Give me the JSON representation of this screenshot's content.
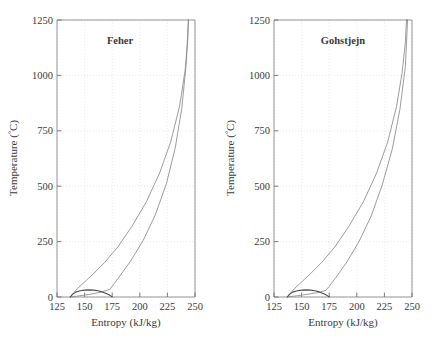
{
  "figure": {
    "panel_count": 2
  },
  "chart_data": [
    {
      "type": "line",
      "title": "Feher",
      "xlabel": "Entropy (kJ/kg)",
      "ylabel": "Temperature (°C)",
      "xlim": [
        125,
        250
      ],
      "ylim": [
        0,
        1250
      ],
      "xticks": [
        125,
        150,
        175,
        200,
        225,
        250
      ],
      "yticks": [
        0,
        250,
        500,
        750,
        1000,
        1250
      ],
      "xtick_labels": [
        "125",
        "150",
        "175",
        "200",
        "225",
        "250"
      ],
      "ytick_labels": [
        "0",
        "250",
        "500",
        "750",
        "1000",
        "1250"
      ],
      "grid": true,
      "legend": "none",
      "series": [
        {
          "name": "saturation-dome",
          "x": [
            137,
            139,
            142,
            146,
            150,
            154,
            158,
            162,
            166,
            169,
            172,
            174,
            175
          ],
          "y": [
            0,
            12,
            22,
            28,
            31,
            32,
            31,
            28,
            23,
            17,
            10,
            4,
            0
          ]
        },
        {
          "name": "cycle-upper-branch",
          "x": [
            137,
            140,
            144,
            150,
            158,
            168,
            180,
            193,
            206,
            218,
            228,
            236,
            241,
            243.5,
            244
          ],
          "y": [
            0,
            18,
            40,
            68,
            105,
            155,
            225,
            320,
            430,
            560,
            700,
            860,
            1020,
            1160,
            1250
          ]
        },
        {
          "name": "cycle-lower-branch",
          "x": [
            137,
            145,
            155,
            165,
            173,
            176,
            182,
            192,
            203,
            214,
            224,
            232,
            238,
            242,
            244
          ],
          "y": [
            0,
            5,
            12,
            22,
            35,
            55,
            95,
            165,
            255,
            370,
            510,
            670,
            850,
            1050,
            1250
          ]
        },
        {
          "name": "cycle-top-closure",
          "x": [
            244,
            244
          ],
          "y": [
            1250,
            1250
          ]
        }
      ]
    },
    {
      "type": "line",
      "title": "Gohstjejn",
      "xlabel": "Entropy (kJ/kg)",
      "ylabel": "Temperature (°C)",
      "xlim": [
        125,
        250
      ],
      "ylim": [
        0,
        1250
      ],
      "xticks": [
        125,
        150,
        175,
        200,
        225,
        250
      ],
      "yticks": [
        0,
        250,
        500,
        750,
        1000,
        1250
      ],
      "xtick_labels": [
        "125",
        "150",
        "175",
        "200",
        "225",
        "250"
      ],
      "ytick_labels": [
        "0",
        "250",
        "500",
        "750",
        "1000",
        "1250"
      ],
      "grid": true,
      "legend": "none",
      "series": [
        {
          "name": "saturation-dome",
          "x": [
            137,
            139,
            142,
            146,
            150,
            154,
            158,
            162,
            166,
            169,
            172,
            174,
            175
          ],
          "y": [
            0,
            12,
            22,
            28,
            31,
            32,
            31,
            28,
            23,
            17,
            10,
            4,
            0
          ]
        },
        {
          "name": "cycle-upper-branch",
          "x": [
            137,
            140,
            144,
            150,
            158,
            168,
            180,
            193,
            206,
            218,
            228,
            236,
            241,
            244,
            245
          ],
          "y": [
            0,
            18,
            40,
            68,
            105,
            155,
            225,
            320,
            430,
            560,
            700,
            860,
            1010,
            1150,
            1250
          ]
        },
        {
          "name": "cycle-lower-branch",
          "x": [
            137,
            145,
            155,
            165,
            172,
            175,
            181,
            191,
            202,
            213,
            223,
            232,
            239,
            244,
            246
          ],
          "y": [
            0,
            5,
            12,
            20,
            30,
            48,
            88,
            158,
            250,
            365,
            505,
            665,
            845,
            1040,
            1250
          ]
        },
        {
          "name": "cycle-top-closure",
          "x": [
            246,
            245
          ],
          "y": [
            1250,
            1250
          ]
        }
      ]
    }
  ],
  "colors": {
    "curve": "#808080",
    "dome": "#555555",
    "axis": "#6e6e6e",
    "grid": "#dcdcdc",
    "text": "#3a3a3a",
    "background": "#ffffff"
  },
  "axis_parts": {
    "degree_symbol": "°",
    "temperature_label_prefix": "Temperature (",
    "temperature_label_suffix": "C)"
  }
}
